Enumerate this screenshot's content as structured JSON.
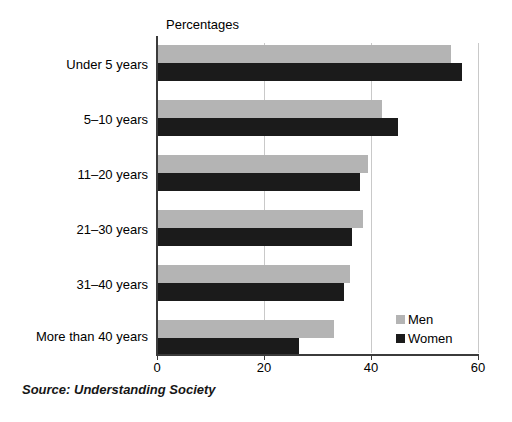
{
  "chart_data": {
    "type": "bar",
    "orientation": "horizontal",
    "title": "",
    "units_caption": "Percentages",
    "categories": [
      "Under 5 years",
      "5–10 years",
      "11–20 years",
      "21–30 years",
      "31–40 years",
      "More than 40 years"
    ],
    "series": [
      {
        "name": "Men",
        "color": "#b4b4b4",
        "values": [
          55,
          42,
          39.5,
          38.5,
          36,
          33
        ]
      },
      {
        "name": "Women",
        "color": "#1b1b1b",
        "values": [
          57,
          45,
          38,
          36.5,
          35,
          26.5
        ]
      }
    ],
    "xlabel": "",
    "ylabel": "",
    "xlim": [
      0,
      60
    ],
    "xticks": [
      0,
      20,
      40,
      60
    ],
    "xtick_labels": [
      "0",
      "20",
      "40",
      "60"
    ],
    "grid": "vertical",
    "legend_position": "bottom-right",
    "legend_entries": [
      "Men",
      "Women"
    ],
    "source_note": "Source: Understanding Society"
  }
}
